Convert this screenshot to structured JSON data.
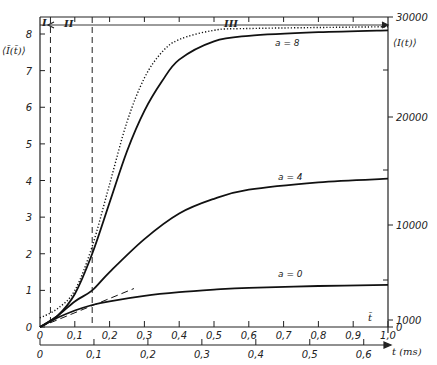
{
  "chart_data": {
    "type": "line",
    "title": "",
    "xlabel": "t (ms)",
    "xlabel_upper": "t̄",
    "ylabel": "⟨Ī(t̄)⟩",
    "ylabel_right": "⟨I(t)⟩",
    "x_upper_ticks": [
      "0",
      "0,1",
      "0,2",
      "0,3",
      "0,4",
      "0,5",
      "0,6",
      "0,7",
      "0,8",
      "0,9",
      "1,0"
    ],
    "x_upper_range": [
      0,
      1.0
    ],
    "x_lower_ticks": [
      "0",
      "0,1",
      "0,2",
      "0,3",
      "0,4",
      "0,5",
      "0,6"
    ],
    "x_lower_range_ms": [
      0,
      0.645
    ],
    "y_left_ticks": [
      "0",
      "1",
      "2",
      "3",
      "4",
      "5",
      "6",
      "7",
      "8"
    ],
    "ylim": [
      0,
      8.4
    ],
    "y_right_ticks": [
      "0",
      "1000",
      "10000",
      "20000",
      "30000"
    ],
    "regions": [
      {
        "label": "I",
        "t_end": 0.03
      },
      {
        "label": "II",
        "t_end": 0.15
      },
      {
        "label": "III",
        "t_end": 1.0
      }
    ],
    "series": [
      {
        "name": "a = 8",
        "style": "solid",
        "x": [
          0,
          0.05,
          0.1,
          0.15,
          0.2,
          0.25,
          0.3,
          0.35,
          0.4,
          0.5,
          0.6,
          0.8,
          1.0
        ],
        "values": [
          0,
          0.3,
          0.9,
          2.0,
          3.4,
          4.8,
          5.9,
          6.7,
          7.3,
          7.8,
          7.95,
          8.05,
          8.1
        ]
      },
      {
        "name": "limit (dotted)",
        "style": "dotted",
        "x": [
          0,
          0.05,
          0.1,
          0.15,
          0.2,
          0.25,
          0.3,
          0.35,
          0.4,
          0.5,
          0.6,
          1.0
        ],
        "values": [
          0.25,
          0.5,
          1.0,
          2.2,
          3.9,
          5.6,
          6.8,
          7.5,
          7.85,
          8.1,
          8.15,
          8.2
        ]
      },
      {
        "name": "a = 4",
        "style": "solid",
        "x": [
          0,
          0.05,
          0.1,
          0.15,
          0.2,
          0.3,
          0.4,
          0.5,
          0.6,
          0.8,
          1.0
        ],
        "values": [
          0,
          0.3,
          0.7,
          1.0,
          1.5,
          2.4,
          3.1,
          3.5,
          3.75,
          3.95,
          4.05
        ]
      },
      {
        "name": "a = 0",
        "style": "solid",
        "x": [
          0,
          0.05,
          0.1,
          0.15,
          0.2,
          0.3,
          0.4,
          0.5,
          0.6,
          0.8,
          1.0
        ],
        "values": [
          0,
          0.25,
          0.45,
          0.6,
          0.7,
          0.85,
          0.95,
          1.02,
          1.07,
          1.12,
          1.15
        ]
      },
      {
        "name": "initial slope (dashed)",
        "style": "dashed",
        "x": [
          0,
          0.27
        ],
        "values": [
          0,
          1.05
        ]
      }
    ],
    "annotations": [
      "a = 8",
      "a = 4",
      "a = 0",
      "I",
      "II",
      "III",
      "t̄"
    ],
    "grid": false,
    "legend": "none"
  },
  "labels": {
    "y_left_title": "⟨Ī(t̄)⟩",
    "y_right_title": "⟨I(t)⟩",
    "x_lower_title": "t (ms)",
    "x_upper_title": "t̄",
    "curve_a8": "a = 8",
    "curve_a4": "a = 4",
    "curve_a0": "a = 0",
    "region_1": "I",
    "region_2": "II",
    "region_3": "III"
  }
}
